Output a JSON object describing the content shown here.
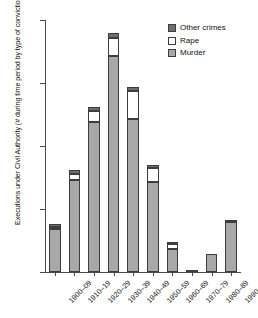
{
  "chart_data": {
    "type": "bar",
    "subtype": "stacked-bar",
    "title": "",
    "xlabel": "",
    "ylabel": "Executions under Civil Authority (# during time period by type of conviction)",
    "ylim": [
      0,
      1600
    ],
    "yticks": [
      0,
      400,
      800,
      1200,
      1600
    ],
    "ytick_labels": [
      "0",
      "400",
      "800",
      "1,200",
      "1,600"
    ],
    "grid": false,
    "legend_position": "top-right",
    "categories": [
      "1900–09",
      "1910–19",
      "1920–29",
      "1930–39",
      "1940–49",
      "1950–59",
      "1960–69",
      "1970–79",
      "1980–89",
      "1990–98"
    ],
    "series": [
      {
        "name": "Murder",
        "color": "#a8a8a8",
        "values": [
          276,
          583,
          953,
          1371,
          969,
          570,
          144,
          3,
          117,
          319
        ]
      },
      {
        "name": "Rape",
        "color": "#ffffff",
        "values": [
          10,
          40,
          68,
          116,
          180,
          92,
          34,
          0,
          0,
          0
        ]
      },
      {
        "name": "Other crimes",
        "color": "#6e6e6e",
        "values": [
          16,
          22,
          24,
          31,
          28,
          20,
          13,
          0,
          0,
          2
        ]
      }
    ],
    "totals": [
      302,
      645,
      1045,
      1518,
      1177,
      682,
      191,
      3,
      117,
      321
    ]
  },
  "legend": {
    "entries": [
      {
        "label": "Other crimes",
        "color": "#6e6e6e"
      },
      {
        "label": "Rape",
        "color": "#ffffff"
      },
      {
        "label": "Murder",
        "color": "#a8a8a8"
      }
    ]
  }
}
